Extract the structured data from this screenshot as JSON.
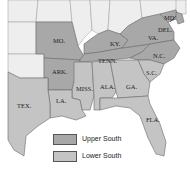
{
  "map": {
    "colors": {
      "upper_south": "#a8a8a8",
      "lower_south": "#c4c4c4",
      "other_land": "#eeeeee",
      "water": "#ffffff",
      "border": "#6a6a6a"
    },
    "state_labels": {
      "mo": "MO.",
      "ky": "KY.",
      "va": "VA.",
      "md": "MD.",
      "del": "DEL.",
      "tenn": "TENN.",
      "nc": "N.C.",
      "ark": "ARK.",
      "sc": "S.C.",
      "miss": "MISS.",
      "ala": "ALA.",
      "ga": "GA.",
      "la": "LA.",
      "tex": "TEX.",
      "fla": "FLA."
    },
    "upper_south_states": [
      "MO.",
      "KY.",
      "VA.",
      "MD.",
      "DEL.",
      "TENN.",
      "N.C.",
      "ARK."
    ],
    "lower_south_states": [
      "S.C.",
      "MISS.",
      "ALA.",
      "GA.",
      "LA.",
      "TEX.",
      "FLA."
    ]
  },
  "legend": {
    "items": [
      {
        "label": "Upper South",
        "color": "#a8a8a8"
      },
      {
        "label": "Lower South",
        "color": "#c4c4c4"
      }
    ]
  }
}
